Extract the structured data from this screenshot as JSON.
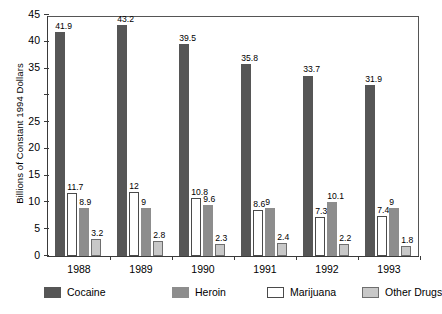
{
  "chart_data": {
    "type": "bar",
    "title": "",
    "xlabel": "",
    "ylabel": "Billions of Constant 1994 Dollars",
    "categories": [
      "1988",
      "1989",
      "1990",
      "1991",
      "1992",
      "1993"
    ],
    "ylim": [
      0,
      45
    ],
    "yticks": [
      0,
      5,
      10,
      15,
      20,
      25,
      30,
      35,
      40,
      45
    ],
    "ytick_labels": [
      "0",
      "5",
      "10",
      "15",
      "20",
      "25",
      "",
      "35",
      "40",
      "45"
    ],
    "grid": false,
    "legend_position": "bottom",
    "series": [
      {
        "name": "Cocaine",
        "color": "#565656",
        "values": [
          41.9,
          43.2,
          39.5,
          35.8,
          33.7,
          31.9
        ],
        "labels": [
          "41.9",
          "43.2",
          "39.5",
          "35.8",
          "33.7",
          "31.9"
        ]
      },
      {
        "name": "Marijuana",
        "color": "#ffffff",
        "values": [
          11.7,
          12,
          10.8,
          8.6,
          7.3,
          7.4
        ],
        "labels": [
          "11.7",
          "12",
          "10.8",
          "8.6",
          "7.3",
          "7.4"
        ]
      },
      {
        "name": "Heroin",
        "color": "#8d8d8d",
        "values": [
          8.9,
          9,
          9.6,
          9,
          10.1,
          9
        ],
        "labels": [
          "8.9",
          "9",
          "9.6",
          "9",
          "10.1",
          "9"
        ]
      },
      {
        "name": "Other Drugs",
        "color": "#c8c8c8",
        "values": [
          3.2,
          2.8,
          2.3,
          2.4,
          2.2,
          1.8
        ],
        "labels": [
          "3.2",
          "2.8",
          "2.3",
          "2.4",
          "2.2",
          "1.8"
        ]
      }
    ]
  },
  "legend": {
    "items": [
      {
        "label": "Cocaine",
        "swatch": "cocaine"
      },
      {
        "label": "Heroin",
        "swatch": "heroin"
      },
      {
        "label": "Marijuana",
        "swatch": "marijuana"
      },
      {
        "label": "Other Drugs",
        "swatch": "other"
      }
    ]
  },
  "footnote": ""
}
